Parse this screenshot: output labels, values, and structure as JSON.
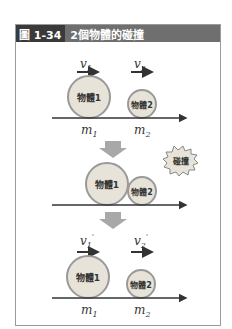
{
  "figure": {
    "number": "圖 1-34",
    "title": "2個物體的碰撞"
  },
  "panels": [
    {
      "name": "before",
      "velocity_labels": [
        "v1",
        "v2"
      ],
      "bodies": [
        "物體1",
        "物體2"
      ],
      "mass_labels": [
        "m1",
        "m2"
      ]
    },
    {
      "name": "collision",
      "bodies": [
        "物體1",
        "物體2"
      ],
      "burst_label": "碰撞"
    },
    {
      "name": "after",
      "velocity_labels": [
        "v1'",
        "v2'"
      ],
      "bodies": [
        "物體1",
        "物體2"
      ],
      "mass_labels": [
        "m1",
        "m2"
      ]
    }
  ],
  "colors": {
    "header_bg": "#6f6f6f",
    "header_num_bg": "#3a3a3a",
    "circle_fill": "#e8e3d9",
    "circle_stroke": "#999999",
    "axis": "#333333",
    "down_arrow": "#a8a8a8"
  }
}
